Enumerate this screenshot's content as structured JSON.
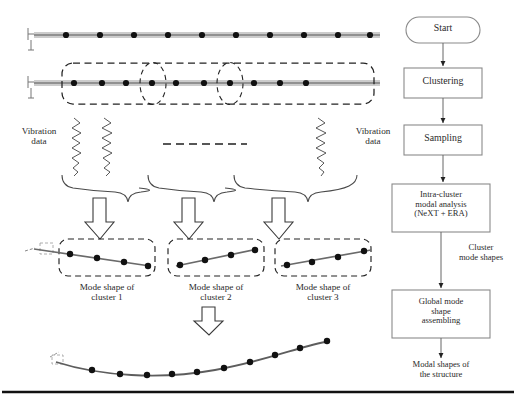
{
  "figure": {
    "caption_rule": true
  },
  "left_panel": {
    "structure_top": {
      "name": "Instrumented beam with sensors",
      "sensor_count": 10,
      "sensor_x": [
        66,
        100,
        134,
        168,
        202,
        236,
        270,
        304,
        338,
        372
      ]
    },
    "structure_clustered": {
      "name": "Beam partitioned into sensor clusters",
      "sensor_count": 12,
      "sensor_x": [
        74,
        102,
        126,
        152,
        176,
        204,
        230,
        256,
        280,
        306
      ],
      "cluster_boxes": 3,
      "overlap_markers": 2
    },
    "vibration_left_label": "Vibration\ndata",
    "vibration_right_label": "Vibration\ndata",
    "continuation_marker": "dashed-ellipsis",
    "waveform_count": 3,
    "brace_count": 3,
    "arrow_count": 3,
    "cluster_results": [
      {
        "label": "Mode shape of\ncluster 1",
        "trend": "down",
        "dots": 4
      },
      {
        "label": "Mode shape of\ncluster 2",
        "trend": "up",
        "dots": 4
      },
      {
        "label": "Mode shape of\ncluster 3",
        "trend": "up",
        "dots": 4
      }
    ],
    "assembly_arrow": "down-block-arrow",
    "global_shape": {
      "name": "Assembled global mode shape",
      "dots": 10
    }
  },
  "flowchart": {
    "nodes": [
      {
        "id": "start",
        "label": "Start",
        "shape": "rounded"
      },
      {
        "id": "clustering",
        "label": "Clustering",
        "shape": "rect"
      },
      {
        "id": "sampling",
        "label": "Sampling",
        "shape": "rect"
      },
      {
        "id": "intra",
        "label": "Intra-cluster\nmodal analysis\n(NeXT + ERA)",
        "shape": "rect"
      },
      {
        "id": "global",
        "label": "Global mode\nshape\nassembling",
        "shape": "rect"
      },
      {
        "id": "result",
        "label": "Modal shapes of\nthe structure",
        "shape": "text"
      }
    ],
    "edge_label": "Cluster\nmode shapes"
  },
  "colors": {
    "ink": "#1a1a1a",
    "line": "#555555",
    "beam": "#808080",
    "box_border": "#8a8a8a",
    "dash": "#222222"
  }
}
